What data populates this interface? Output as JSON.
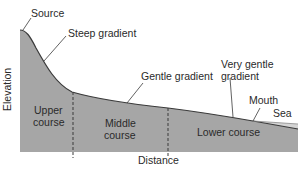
{
  "diagram": {
    "axes": {
      "y_label": "Elevation",
      "x_label": "Distance"
    },
    "annotations": {
      "source": "Source",
      "steep": "Steep gradient",
      "gentle": "Gentle gradient",
      "very_gentle_1": "Very gentle",
      "very_gentle_2": "gradient",
      "mouth": "Mouth",
      "sea": "Sea"
    },
    "sections": {
      "upper_1": "Upper",
      "upper_2": "course",
      "middle_1": "Middle",
      "middle_2": "course",
      "lower": "Lower course"
    },
    "colors": {
      "land": "#a6a6a6",
      "outline": "#3a3a3a",
      "sea": "#d4d4d4",
      "text": "#2a2a2a"
    }
  }
}
